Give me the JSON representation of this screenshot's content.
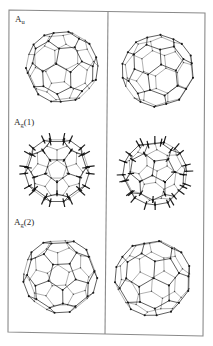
{
  "figure": {
    "frame": {
      "top_left": [
        9,
        10
      ],
      "top_right": [
        205,
        13
      ],
      "bottom_right": [
        203,
        336
      ],
      "bottom_left": [
        8,
        332
      ],
      "divider_top": [
        108,
        11
      ],
      "divider_bottom": [
        105,
        334
      ],
      "color": "#8a8a8a"
    },
    "labels": [
      {
        "main": "A",
        "sub": "u",
        "suffix": "",
        "x": 15,
        "y": 15
      },
      {
        "main": "A",
        "sub": "g",
        "suffix": "(1)",
        "x": 14,
        "y": 118
      },
      {
        "main": "A",
        "sub": "g",
        "suffix": "(2)",
        "x": 14,
        "y": 218
      }
    ],
    "molecules": [
      {
        "name": "au-left",
        "mode": "Au",
        "cx": 62,
        "cy": 67,
        "r": 36,
        "rotX": 0.35,
        "rotY": 0.2,
        "rotZ": 0.1,
        "spikes": false
      },
      {
        "name": "au-right",
        "mode": "Au",
        "cx": 158,
        "cy": 71,
        "r": 36,
        "rotX": 0.3,
        "rotY": 0.45,
        "rotZ": 0.25,
        "spikes": false
      },
      {
        "name": "ag1-left",
        "mode": "Ag(1)",
        "cx": 57,
        "cy": 170,
        "r": 32,
        "rotX": 0.55,
        "rotY": 0.0,
        "rotZ": 0.0,
        "spikes": true
      },
      {
        "name": "ag1-right",
        "mode": "Ag(1)",
        "cx": 155,
        "cy": 173,
        "r": 32,
        "rotX": 0.5,
        "rotY": 0.25,
        "rotZ": 0.15,
        "spikes": true
      },
      {
        "name": "ag2-left",
        "mode": "Ag(2)",
        "cx": 60,
        "cy": 276,
        "r": 37,
        "rotX": 0.55,
        "rotY": 0.05,
        "rotZ": 0.05,
        "spikes": false
      },
      {
        "name": "ag2-right",
        "mode": "Ag(2)",
        "cx": 153,
        "cy": 278,
        "r": 38,
        "rotX": 0.45,
        "rotY": 0.35,
        "rotZ": 0.2,
        "spikes": false
      }
    ],
    "style": {
      "bond_color": "#1f1f1f",
      "atom_color": "#111111",
      "spike_color": "#1a1a1a"
    }
  }
}
